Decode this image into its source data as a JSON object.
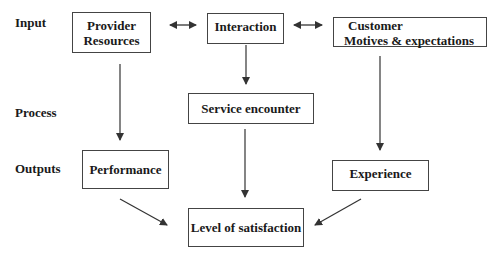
{
  "diagram": {
    "row_labels": {
      "input": "Input",
      "process": "Process",
      "outputs": "Outputs"
    },
    "nodes": {
      "provider_resources": {
        "line1": "Provider",
        "line2": "Resources"
      },
      "interaction": {
        "label": "Interaction"
      },
      "customer": {
        "line1": "Customer",
        "line2": "Motives & expectations"
      },
      "service_encounter": {
        "label": "Service encounter"
      },
      "performance": {
        "label": "Performance"
      },
      "experience": {
        "label": "Experience"
      },
      "level_of_satisfaction": {
        "label": "Level of satisfaction"
      }
    },
    "edges": [
      {
        "from": "provider_resources",
        "to": "interaction",
        "type": "bidirectional"
      },
      {
        "from": "interaction",
        "to": "customer",
        "type": "bidirectional"
      },
      {
        "from": "provider_resources",
        "to": "performance",
        "type": "arrow"
      },
      {
        "from": "interaction",
        "to": "service_encounter",
        "type": "arrow"
      },
      {
        "from": "customer",
        "to": "experience",
        "type": "arrow"
      },
      {
        "from": "service_encounter",
        "to": "level_of_satisfaction",
        "type": "arrow"
      },
      {
        "from": "performance",
        "to": "level_of_satisfaction",
        "type": "arrow"
      },
      {
        "from": "experience",
        "to": "level_of_satisfaction",
        "type": "arrow"
      }
    ],
    "colors": {
      "line": "#333333",
      "box_border": "#444444",
      "text": "#1a1a1a"
    }
  }
}
